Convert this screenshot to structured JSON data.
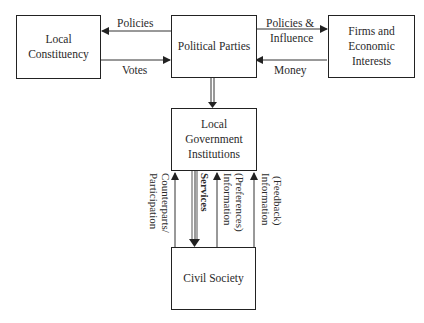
{
  "diagram": {
    "nodes": {
      "local_constituency": {
        "line1": "Local",
        "line2": "Constituency"
      },
      "political_parties": {
        "line1": "Political Parties"
      },
      "firms": {
        "line1": "Firms and",
        "line2": "Economic",
        "line3": "Interests"
      },
      "local_government": {
        "line1": "Local",
        "line2": "Government",
        "line3": "Institutions"
      },
      "civil_society": {
        "line1": "Civil Society"
      }
    },
    "edges": {
      "policies": "Policies",
      "votes": "Votes",
      "policies_influence_1": "Policies &",
      "policies_influence_2": "Influence",
      "money": "Money",
      "counterparts_1": "Counterparts/",
      "counterparts_2": "Participation",
      "services": "Services",
      "info_pref_1": "Information",
      "info_pref_2": "(Preferences)",
      "info_feed_1": "Information",
      "info_feed_2": "(Feedback)"
    }
  }
}
